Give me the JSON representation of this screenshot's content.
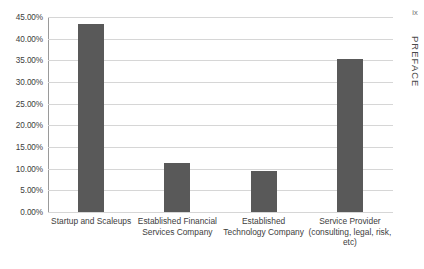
{
  "page": {
    "folio": "ix",
    "running_head": "PREFACE"
  },
  "chart_data": {
    "type": "bar",
    "title": "",
    "xlabel": "",
    "ylabel": "",
    "categories": [
      "Startup and Scaleups",
      "Established Financial Services Company",
      "Established Technology Company",
      "Service Provider (consulting, legal, risk, etc)"
    ],
    "values": [
      43.4,
      11.2,
      9.4,
      35.4
    ],
    "value_labels": [
      "43.40%",
      "11.20%",
      "9.40%",
      "35.40%"
    ],
    "ylim": [
      0,
      45
    ],
    "ytick_values": [
      0,
      5,
      10,
      15,
      20,
      25,
      30,
      35,
      40,
      45
    ],
    "ytick_labels": [
      "0.00%",
      "5.00%",
      "10.00%",
      "15.00%",
      "20.00%",
      "25.00%",
      "30.00%",
      "35.00%",
      "40.00%",
      "45.00%"
    ],
    "grid": true,
    "legend": false,
    "legend_position": "none",
    "bar_color": "#595959",
    "gridline_color": "#d6d6d6",
    "axis_color": "#9a9a9a",
    "text_color": "#3d3d3d"
  }
}
